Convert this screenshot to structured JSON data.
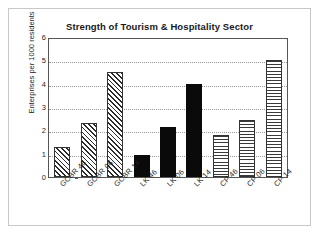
{
  "chart_data": {
    "type": "bar",
    "title": "Strength of Tourism & Hospitality Sector",
    "xlabel": "",
    "ylabel": "Enterprises per 1000 residents",
    "ylim": [
      0,
      6
    ],
    "yticks": [
      0,
      1,
      2,
      3,
      4,
      5,
      6
    ],
    "ytick_labels": [
      "0",
      "1",
      "2",
      "3",
      "4",
      "5",
      "6"
    ],
    "grid": true,
    "grid_axis": "y",
    "legend": null,
    "legend_position": "none",
    "categories": [
      "GCBR 46",
      "GCBR 06",
      "GCBR 14",
      "LK 46",
      "LK 06",
      "LK 14",
      "CP 46",
      "CP 06",
      "CP 14"
    ],
    "values": [
      1.3,
      2.3,
      4.5,
      0.95,
      2.15,
      4.0,
      1.8,
      2.45,
      5.0
    ],
    "bar_patterns": [
      "diagonal-hatch",
      "diagonal-hatch",
      "diagonal-hatch",
      "solid-black",
      "solid-black",
      "solid-black",
      "horizontal-stripes",
      "horizontal-stripes",
      "horizontal-stripes"
    ],
    "groups": [
      {
        "name": "GCBR",
        "pattern": "diagonal-hatch",
        "categories": [
          "GCBR 46",
          "GCBR 06",
          "GCBR 14"
        ],
        "values": [
          1.3,
          2.3,
          4.5
        ]
      },
      {
        "name": "LK",
        "pattern": "solid-black",
        "categories": [
          "LK 46",
          "LK 06",
          "LK 14"
        ],
        "values": [
          0.95,
          2.15,
          4.0
        ]
      },
      {
        "name": "CP",
        "pattern": "horizontal-stripes",
        "categories": [
          "CP 46",
          "CP 06",
          "CP 14"
        ],
        "values": [
          1.8,
          2.45,
          5.0
        ]
      }
    ],
    "colors": {
      "bar_outline": "#333333",
      "solid_fill": "#0a0a0a",
      "hatch": "#2b2b2b",
      "axis": "#565656",
      "gridline": "#9a9a9a",
      "text": "#1f1f1f",
      "frame": "#c8c8c8",
      "background": "#ffffff"
    }
  }
}
